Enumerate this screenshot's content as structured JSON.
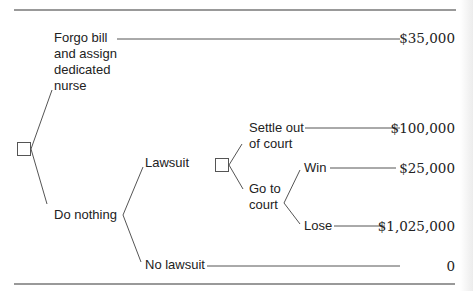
{
  "diagram": {
    "type": "decision-tree",
    "colors": {
      "line": "#555555",
      "rule": "#777777",
      "text": "#222222"
    },
    "root": {
      "node": "decision",
      "options": [
        {
          "label": "Forgo bill\nand assign\ndedicated\nnurse",
          "outcome": "$35,000"
        },
        {
          "label": "Do nothing",
          "branches": [
            {
              "label": "Lawsuit",
              "node": "decision",
              "options": [
                {
                  "label": "Settle out\nof court",
                  "outcome": "$100,000"
                },
                {
                  "label": "Go to\ncourt",
                  "branches": [
                    {
                      "label": "Win",
                      "outcome": "$25,000"
                    },
                    {
                      "label": "Lose",
                      "outcome": "$1,025,000"
                    }
                  ]
                }
              ]
            },
            {
              "label": "No lawsuit",
              "outcome": "0"
            }
          ]
        }
      ]
    }
  },
  "labels": {
    "forgo": "Forgo bill\nand assign\ndedicated\nnurse",
    "do_nothing": "Do nothing",
    "lawsuit": "Lawsuit",
    "no_lawsuit": "No lawsuit",
    "settle": "Settle out\nof court",
    "go_to_court": "Go to\ncourt",
    "win": "Win",
    "lose": "Lose"
  },
  "values": {
    "forgo": "$35,000",
    "settle": "$100,000",
    "win": "$25,000",
    "lose": "$1,025,000",
    "no_lawsuit": "0"
  }
}
